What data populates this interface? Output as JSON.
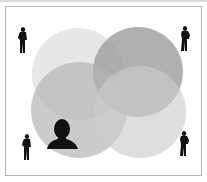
{
  "diagram": {
    "type": "venn",
    "circle_count": 4,
    "circles": [
      {
        "id": "top-left",
        "cx": 78,
        "cy": 74,
        "r": 46,
        "color": "#e6e6e6",
        "opacity": 0.85
      },
      {
        "id": "top-right",
        "cx": 138,
        "cy": 72,
        "r": 45,
        "color": "#9a9a9a",
        "opacity": 0.8
      },
      {
        "id": "bottom-left",
        "cx": 79,
        "cy": 110,
        "r": 48,
        "color": "#b8b8b8",
        "opacity": 0.7
      },
      {
        "id": "bottom-right",
        "cx": 140,
        "cy": 112,
        "r": 46,
        "color": "#cfcfcf",
        "opacity": 0.65
      }
    ],
    "central_icon": "person-head-icon",
    "corner_icons": [
      "standing-person-icon",
      "standing-person-icon",
      "standing-person-icon",
      "standing-person-icon"
    ],
    "colors": {
      "frame_border": "#b5b5b5",
      "background": "#ffffff",
      "silhouette": "#111111"
    }
  }
}
